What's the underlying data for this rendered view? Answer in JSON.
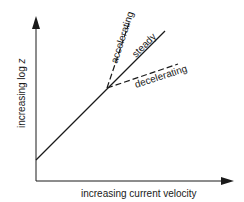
{
  "diagram": {
    "x_axis_label": "increasing current velocity",
    "y_axis_label_prefix": "increasing log ",
    "y_axis_label_var": "z",
    "curves": [
      {
        "name": "steady",
        "label": "steady",
        "style": "solid"
      },
      {
        "name": "accelerating",
        "label": "accelerating",
        "style": "dashed"
      },
      {
        "name": "decelerating",
        "label": "decelerating",
        "style": "dashed"
      }
    ],
    "colors": {
      "line": "#1a1a1a",
      "background": "#ffffff"
    }
  }
}
